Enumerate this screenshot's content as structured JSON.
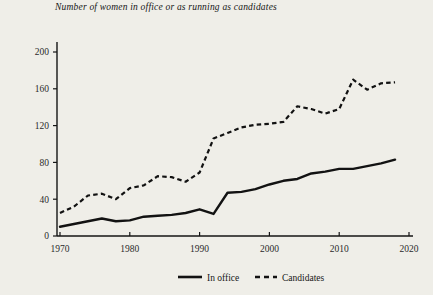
{
  "chart_data": {
    "type": "line",
    "title": "Number of women in office or as running as candidates",
    "xlabel": "",
    "ylabel": "",
    "xlim": [
      1968,
      2021
    ],
    "ylim": [
      0,
      215
    ],
    "xticks": [
      1970,
      1980,
      1990,
      2000,
      2010,
      2020
    ],
    "yticks": [
      0,
      40,
      80,
      120,
      160,
      200
    ],
    "grid": false,
    "legend_position": "bottom-center",
    "x": [
      1970,
      1972,
      1974,
      1976,
      1978,
      1980,
      1982,
      1984,
      1986,
      1988,
      1990,
      1992,
      1994,
      1996,
      1998,
      2000,
      2002,
      2004,
      2006,
      2008,
      2010,
      2012,
      2014,
      2016,
      2018
    ],
    "series": [
      {
        "name": "In office",
        "style": "solid",
        "color": "#121212",
        "values": [
          10,
          13,
          16,
          19,
          16,
          17,
          21,
          22,
          23,
          25,
          29,
          24,
          47,
          48,
          51,
          56,
          60,
          62,
          68,
          70,
          73,
          73,
          76,
          79,
          83
        ]
      },
      {
        "name": "Candidates",
        "style": "dashed",
        "color": "#121212",
        "values": [
          25,
          32,
          44,
          46,
          40,
          52,
          55,
          65,
          64,
          59,
          69,
          106,
          112,
          118,
          121,
          122,
          124,
          141,
          138,
          133,
          138,
          170,
          159,
          166,
          167
        ]
      }
    ]
  },
  "legend": {
    "in_office_label": "In office",
    "candidates_label": "Candidates"
  },
  "axis": {
    "x_tick_labels": [
      "1970",
      "1980",
      "1990",
      "2000",
      "2010",
      "2020"
    ],
    "y_tick_labels": [
      "0",
      "40",
      "80",
      "120",
      "160",
      "200"
    ]
  }
}
